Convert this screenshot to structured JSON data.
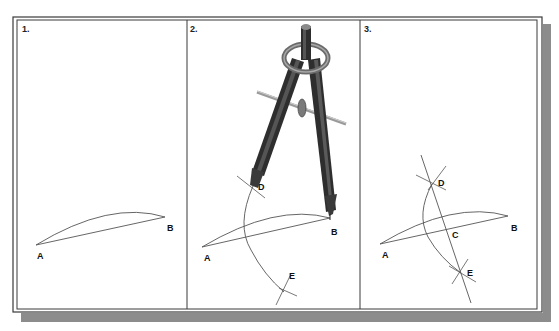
{
  "figure": {
    "colors": {
      "frame": "#3a3a3a",
      "shadow": "#8c8c8c",
      "line": "#555555",
      "compass_dark": "#2e2e2e",
      "compass_mid": "#6b6b6b",
      "compass_light": "#a8a8a8"
    },
    "panels": [
      {
        "step": "1.",
        "points": {
          "A": "A",
          "B": "B"
        },
        "description": "Line segment AB with arc"
      },
      {
        "step": "2.",
        "points": {
          "A": "A",
          "B": "B",
          "D": "D",
          "E": "E"
        },
        "description": "Compass centered at B draws arc through D and E"
      },
      {
        "step": "3.",
        "points": {
          "A": "A",
          "B": "B",
          "C": "C",
          "D": "D",
          "E": "E"
        },
        "description": "Line DE bisects AB at C"
      }
    ]
  }
}
